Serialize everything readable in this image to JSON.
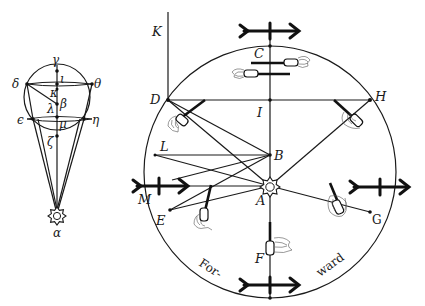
{
  "figure": {
    "left_diagram": {
      "labels": {
        "alpha": "α",
        "beta": "β",
        "gamma": "γ",
        "delta": "δ",
        "epsilon": "ϵ",
        "zeta": "ζ",
        "eta": "η",
        "theta": "θ",
        "iota": "ι",
        "kappa": "κ",
        "lambda": "λ",
        "mu": "μ"
      }
    },
    "main_diagram": {
      "labels": {
        "A": "A",
        "B": "B",
        "C": "C",
        "D": "D",
        "E": "E",
        "F": "F",
        "G": "G",
        "H": "H",
        "I": "I",
        "K": "K",
        "L": "L",
        "M": "M"
      },
      "caption_left": "For-",
      "caption_right": "ward"
    },
    "icons": {
      "sun": "sun-icon",
      "arrow": "arrow-icon",
      "boat": "boat-icon"
    },
    "colors": {
      "ink": "#1a1a1a",
      "paper": "#ffffff",
      "foam": "#555555"
    }
  }
}
